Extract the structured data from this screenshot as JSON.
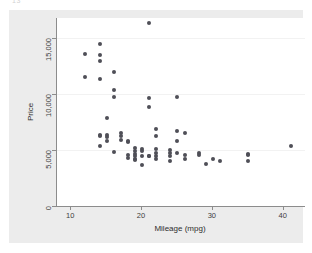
{
  "top_fragment": "13",
  "chart_data": {
    "type": "scatter",
    "title": "",
    "xlabel": "Mileage (mpg)",
    "ylabel": "Price",
    "xlim": [
      8,
      43
    ],
    "ylim": [
      0,
      16800
    ],
    "xticks": [
      10,
      20,
      30,
      40
    ],
    "xtick_labels": [
      "10",
      "20",
      "30",
      "40"
    ],
    "yticks": [
      0,
      5000,
      10000,
      15000
    ],
    "ytick_labels": [
      "0",
      "5,000",
      "10,000",
      "15,000"
    ],
    "grid": "horizontal",
    "legend": null,
    "marker_color": "#4f4f57",
    "panel_color": "#ffffff",
    "background_color": "#ececec",
    "points": [
      [
        12,
        13594
      ],
      [
        12,
        11497
      ],
      [
        14,
        14500
      ],
      [
        14,
        13507
      ],
      [
        14,
        12990
      ],
      [
        14,
        11385
      ],
      [
        15,
        7827
      ],
      [
        16,
        11995
      ],
      [
        16,
        10372
      ],
      [
        16,
        9735
      ],
      [
        14,
        6342
      ],
      [
        14,
        6229
      ],
      [
        14,
        5379
      ],
      [
        15,
        6303
      ],
      [
        15,
        6165
      ],
      [
        15,
        5788
      ],
      [
        16,
        4816
      ],
      [
        17,
        6486
      ],
      [
        17,
        6295
      ],
      [
        17,
        5899
      ],
      [
        18,
        5705
      ],
      [
        18,
        5799
      ],
      [
        18,
        4589
      ],
      [
        18,
        4296
      ],
      [
        19,
        5222
      ],
      [
        19,
        4934
      ],
      [
        19,
        4647
      ],
      [
        19,
        4424
      ],
      [
        19,
        4172
      ],
      [
        19,
        4099
      ],
      [
        20,
        5079
      ],
      [
        20,
        4890
      ],
      [
        20,
        4482
      ],
      [
        20,
        3667
      ],
      [
        21,
        16330
      ],
      [
        21,
        9690
      ],
      [
        21,
        8814
      ],
      [
        21,
        4482
      ],
      [
        21,
        4424
      ],
      [
        22,
        5104
      ],
      [
        22,
        4723
      ],
      [
        22,
        4424
      ],
      [
        22,
        4187
      ],
      [
        22,
        6850
      ],
      [
        22,
        6229
      ],
      [
        24,
        5006
      ],
      [
        24,
        4697
      ],
      [
        24,
        4425
      ],
      [
        24,
        4060
      ],
      [
        25,
        9735
      ],
      [
        25,
        6695
      ],
      [
        25,
        5798
      ],
      [
        25,
        4697
      ],
      [
        26,
        6486
      ],
      [
        26,
        4589
      ],
      [
        26,
        4195
      ],
      [
        28,
        4696
      ],
      [
        28,
        4516
      ],
      [
        29,
        3748
      ],
      [
        30,
        4172
      ],
      [
        31,
        4011
      ],
      [
        35,
        4647
      ],
      [
        35,
        4589
      ],
      [
        35,
        3995
      ],
      [
        41,
        5397
      ]
    ]
  }
}
